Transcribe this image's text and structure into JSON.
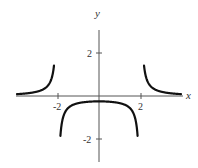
{
  "chart_data": {
    "type": "line",
    "title": "",
    "function": "y = 1/(x^2 - 4)",
    "xlabel": "x",
    "ylabel": "y",
    "xlim": [
      -4,
      4
    ],
    "ylim": [
      -3,
      3
    ],
    "grid": false,
    "legend": null,
    "x_ticks": [
      {
        "value": -2,
        "label": "-2"
      },
      {
        "value": 2,
        "label": "2"
      }
    ],
    "y_ticks": [
      {
        "value": 2,
        "label": "2"
      },
      {
        "value": -2,
        "label": "-2"
      }
    ],
    "asymptotes": {
      "vertical": [
        -2,
        2
      ],
      "horizontal": [
        0
      ]
    },
    "series": [
      {
        "name": "left branch",
        "x": [
          -3.95,
          -3.5,
          -3.0,
          -2.6,
          -2.4,
          -2.3,
          -2.25,
          -2.2,
          -2.17
        ],
        "y": [
          0.087,
          0.121,
          0.2,
          0.362,
          0.568,
          0.775,
          0.941,
          1.19,
          1.45
        ]
      },
      {
        "name": "middle branch",
        "x": [
          -1.86,
          -1.8,
          -1.7,
          -1.5,
          -1.0,
          0.0,
          1.0,
          1.5,
          1.7,
          1.8,
          1.86
        ],
        "y": [
          -1.86,
          -1.32,
          -0.901,
          -0.571,
          -0.333,
          -0.25,
          -0.333,
          -0.571,
          -0.901,
          -1.32,
          -1.86
        ]
      },
      {
        "name": "right branch",
        "x": [
          2.17,
          2.2,
          2.25,
          2.3,
          2.4,
          2.6,
          3.0,
          3.5,
          3.95
        ],
        "y": [
          1.45,
          1.19,
          0.941,
          0.775,
          0.568,
          0.362,
          0.2,
          0.121,
          0.087
        ]
      }
    ]
  },
  "labels": {
    "x_axis": "x",
    "y_axis": "y",
    "x_tick_neg2": "-2",
    "x_tick_2": "2",
    "y_tick_2": "2",
    "y_tick_neg2": "-2"
  }
}
